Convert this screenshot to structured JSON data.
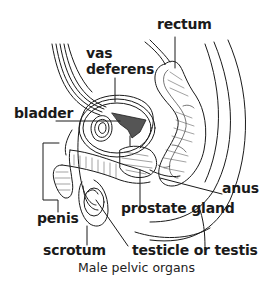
{
  "diagram": {
    "caption": "Male pelvic organs",
    "labels": {
      "rectum": "rectum",
      "vas_line1": "vas",
      "vas_line2": "deferens",
      "bladder": "bladder",
      "anus": "anus",
      "penis": "penis",
      "prostate": "prostate gland",
      "scrotum": "scrotum",
      "testicle": "testicle or testis"
    },
    "colors": {
      "line": "#1a1a1a",
      "background": "#ffffff"
    }
  }
}
